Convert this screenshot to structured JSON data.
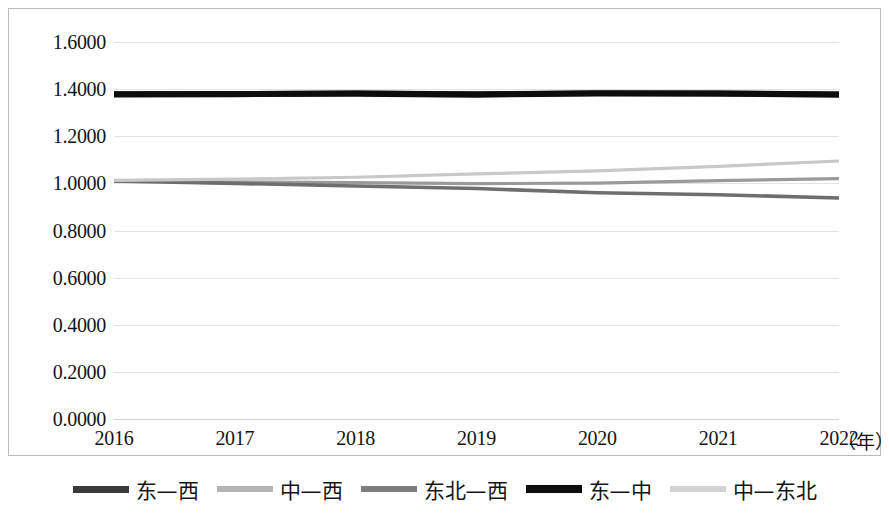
{
  "chart_data": {
    "type": "line",
    "title": "",
    "subtitle": "",
    "xlabel": "（年）",
    "ylabel": "",
    "x": [
      2016,
      2017,
      2018,
      2019,
      2020,
      2021,
      2022
    ],
    "xtick_labels": [
      "2016",
      "2017",
      "2018",
      "2019",
      "2020",
      "2021",
      "2022"
    ],
    "ytick_labels": [
      "0.0000",
      "0.2000",
      "0.4000",
      "0.6000",
      "0.8000",
      "1.0000",
      "1.2000",
      "1.4000",
      "1.6000"
    ],
    "ytick_values": [
      0.0,
      0.2,
      0.4,
      0.6,
      0.8,
      1.0,
      1.2,
      1.4,
      1.6
    ],
    "ylim": [
      0.0,
      1.6
    ],
    "grid": true,
    "legend_position": "bottom",
    "series": [
      {
        "name": "东—西",
        "color": "#3a3a3a",
        "width": 5.5,
        "values": [
          1.379,
          1.38,
          1.382,
          1.379,
          1.383,
          1.382,
          1.378
        ]
      },
      {
        "name": "中—西",
        "color": "#9a9a9a",
        "width": 3.2,
        "values": [
          1.008,
          1.006,
          1.003,
          0.999,
          1.001,
          1.012,
          1.02
        ]
      },
      {
        "name": "东北—西",
        "color": "#6e6e6e",
        "width": 3.6,
        "values": [
          1.01,
          1.0,
          0.989,
          0.978,
          0.96,
          0.952,
          0.938
        ]
      },
      {
        "name": "东—中",
        "color": "#0d0d0d",
        "width": 6.2,
        "values": [
          1.378,
          1.379,
          1.381,
          1.377,
          1.382,
          1.381,
          1.377
        ]
      },
      {
        "name": "中—东北",
        "color": "#c8c8c8",
        "width": 3.2,
        "values": [
          1.013,
          1.018,
          1.026,
          1.04,
          1.053,
          1.072,
          1.095
        ]
      }
    ]
  },
  "axes": {
    "y_labels": [
      "1.6000",
      "1.4000",
      "1.2000",
      "1.0000",
      "0.8000",
      "0.6000",
      "0.4000",
      "0.2000",
      "0.0000"
    ],
    "x_labels": [
      "2016",
      "2017",
      "2018",
      "2019",
      "2020",
      "2021",
      "2022"
    ],
    "x_unit": "（年）"
  },
  "legend": {
    "items": [
      {
        "label": "东—西",
        "color": "#3a3a3a",
        "thickness": 7
      },
      {
        "label": "中—西",
        "color": "#b4b4b4",
        "thickness": 6
      },
      {
        "label": "东北—西",
        "color": "#7d7d7d",
        "thickness": 6
      },
      {
        "label": "东—中",
        "color": "#0d0d0d",
        "thickness": 8
      },
      {
        "label": "中—东北",
        "color": "#d2d2d2",
        "thickness": 6
      }
    ]
  },
  "colors": {
    "background": "#ffffff",
    "frame": "#b9b9b9",
    "gridline": "#e2e2e2",
    "text": "#141414"
  }
}
